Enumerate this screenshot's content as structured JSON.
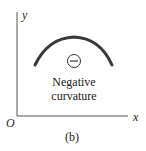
{
  "diagram": {
    "axis_x_label": "x",
    "axis_y_label": "y",
    "origin_label": "O",
    "sign_symbol": "−",
    "caption_line1": "Negative",
    "caption_line2": "curvature",
    "subfigure_label": "(b)",
    "curve_color": "#3a3a3a",
    "axis_color": "#555555"
  }
}
